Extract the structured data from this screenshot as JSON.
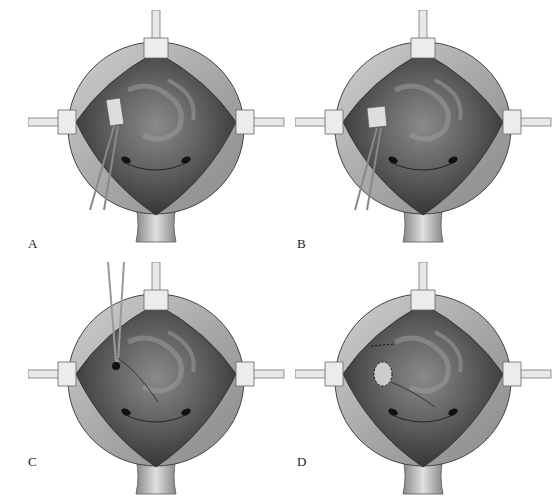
{
  "figure": {
    "panels": [
      {
        "id": "A",
        "label": "A",
        "description": "Bladder opened with retractors; forceps grasping tissue near left ureteral orifice"
      },
      {
        "id": "B",
        "label": "B",
        "description": "Forceps holding tissue with sleeve dissected"
      },
      {
        "id": "C",
        "label": "C",
        "description": "Scissors/forceps from above creating tunnel toward ureteral orifice"
      },
      {
        "id": "D",
        "label": "D",
        "description": "Completed reimplantation with sutured neo-orifice"
      }
    ],
    "colors": {
      "background": "#ffffff",
      "bladder_wall": "#b5b5b5",
      "mucosa_dark": "#4a4a4a",
      "retractor": "#e6e6e6"
    }
  }
}
